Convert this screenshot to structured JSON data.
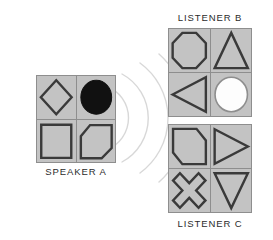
{
  "diagram": {
    "title_implicit": "Speaker and listener mental representations",
    "colors": {
      "cell_fill": "#c3c3c3",
      "grid_line": "#8e8e8e",
      "shape_stroke": "#3a3a3a",
      "shape_fill_light": "#c3c3c3",
      "filled_black": "#111111",
      "filled_white": "#fdfdfd",
      "wave_stroke": "#d6d6d6",
      "label_text": "#2b2b2b",
      "page_background": "#ffffff"
    },
    "panels": [
      {
        "id": "speaker-a",
        "label": "SPEAKER  A",
        "label_position": "bottom",
        "geometry": {
          "x": 36,
          "y": 75,
          "w": 80,
          "h": 88
        },
        "cells": [
          {
            "position": "top-left",
            "shape": "diamond",
            "fill": "light"
          },
          {
            "position": "top-right",
            "shape": "circle",
            "fill": "black"
          },
          {
            "position": "bottom-left",
            "shape": "square",
            "fill": "light"
          },
          {
            "position": "bottom-right",
            "shape": "clipped-parallelogram",
            "fill": "light"
          }
        ]
      },
      {
        "id": "listener-b",
        "label": "LISTENER  B",
        "label_position": "top",
        "geometry": {
          "x": 168,
          "y": 28,
          "w": 84,
          "h": 89
        },
        "cells": [
          {
            "position": "top-left",
            "shape": "octagon",
            "fill": "light"
          },
          {
            "position": "top-right",
            "shape": "triangle-up",
            "fill": "light"
          },
          {
            "position": "bottom-left",
            "shape": "triangle-left",
            "fill": "light"
          },
          {
            "position": "bottom-right",
            "shape": "circle",
            "fill": "white"
          }
        ]
      },
      {
        "id": "listener-c",
        "label": "LISTENER  C",
        "label_position": "bottom",
        "geometry": {
          "x": 168,
          "y": 124,
          "w": 84,
          "h": 89
        },
        "cells": [
          {
            "position": "top-left",
            "shape": "clipped-pentagon",
            "fill": "light"
          },
          {
            "position": "top-right",
            "shape": "triangle-right",
            "fill": "light"
          },
          {
            "position": "bottom-left",
            "shape": "cross-x",
            "fill": "light"
          },
          {
            "position": "bottom-right",
            "shape": "triangle-down",
            "fill": "light"
          }
        ]
      }
    ],
    "sound_waves": {
      "name": "concentric-sound-arcs",
      "arc_count": 4,
      "origin": "speaker-a right edge",
      "direction": "rightward toward listeners"
    }
  }
}
